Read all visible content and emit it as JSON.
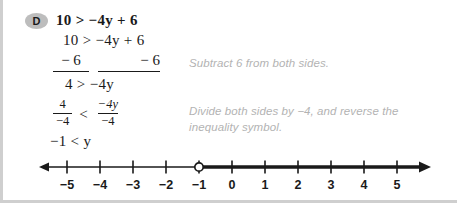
{
  "badge": {
    "label": "D"
  },
  "problem": {
    "line1": "10 > −4y + 6",
    "line2": "10 > −4y + 6",
    "subtract_left": "− 6",
    "subtract_right": "− 6",
    "line4": "4 > −4y",
    "fraction_left_num": "4",
    "fraction_left_den": "−4",
    "relation": "<",
    "fraction_right_num": "−4y",
    "fraction_right_den": "−4",
    "line7": "−1 < y"
  },
  "annotations": {
    "step1": "Subtract 6 from both sides.",
    "step2": "Divide both sides by −4, and reverse the\ninequality symbol."
  },
  "number_line": {
    "labels": [
      "−5",
      "−4",
      "−3",
      "−2",
      "−1",
      "0",
      "1",
      "2",
      "3",
      "4",
      "5"
    ],
    "values": [
      -5,
      -4,
      -3,
      -2,
      -1,
      0,
      1,
      2,
      3,
      4,
      5
    ],
    "solution": {
      "endpoint_value": -1,
      "endpoint_type": "open-circle",
      "direction": "right",
      "description": "y > −1"
    },
    "left_arrow": true,
    "right_arrow": true
  },
  "colors": {
    "text": "#1a1a1a",
    "annotation": "#b3b3b3",
    "badge_bg": "#bdbdbd",
    "border": "#cfcfcf",
    "background": "#ffffff"
  }
}
